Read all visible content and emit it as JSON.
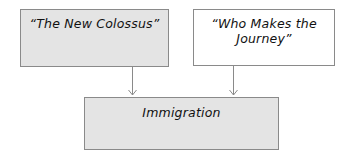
{
  "diagram": {
    "type": "flow",
    "nodes": [
      {
        "id": "new-colossus",
        "label": "“The New Colossus”",
        "style": "shaded"
      },
      {
        "id": "who-makes-journey",
        "label": "“Who Makes the Journey”",
        "style": "plain"
      },
      {
        "id": "immigration",
        "label": "Immigration",
        "style": "shaded"
      }
    ],
    "edges": [
      {
        "from": "new-colossus",
        "to": "immigration"
      },
      {
        "from": "who-makes-journey",
        "to": "immigration"
      }
    ],
    "colors": {
      "box_fill_shaded": "#e4e4e4",
      "box_fill_plain": "#ffffff",
      "border": "#8a8a8a",
      "arrow": "#8a8a8a"
    }
  }
}
